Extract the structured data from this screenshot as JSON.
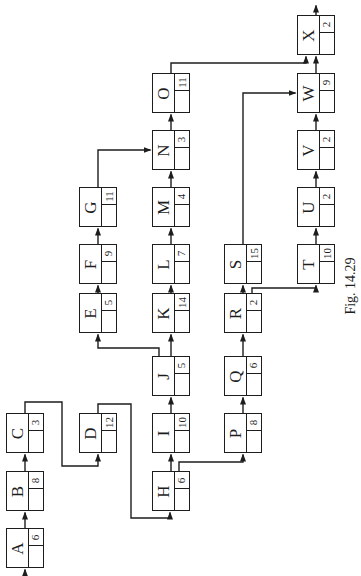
{
  "figure": {
    "caption": "Fig. 14.29",
    "kind": "activity-network-diagram",
    "orientation": "rotated-90-ccw"
  },
  "colors": {
    "background": "#ffffff",
    "ink": "#1d1d1d"
  },
  "diagram": {
    "nodes": [
      {
        "id": "A",
        "duration": "6",
        "col": 0,
        "row": 9
      },
      {
        "id": "B",
        "duration": "8",
        "col": 0,
        "row": 8
      },
      {
        "id": "C",
        "duration": "3",
        "col": 0,
        "row": 7
      },
      {
        "id": "D",
        "duration": "12",
        "col": 1,
        "row": 7
      },
      {
        "id": "E",
        "duration": "5",
        "col": 1,
        "row": 5
      },
      {
        "id": "F",
        "duration": "9",
        "col": 1,
        "row": 4
      },
      {
        "id": "G",
        "duration": "11",
        "col": 1,
        "row": 3
      },
      {
        "id": "H",
        "duration": "6",
        "col": 2,
        "row": 8
      },
      {
        "id": "I",
        "duration": "10",
        "col": 2,
        "row": 7
      },
      {
        "id": "J",
        "duration": "5",
        "col": 2,
        "row": 6
      },
      {
        "id": "K",
        "duration": "14",
        "col": 2,
        "row": 5
      },
      {
        "id": "L",
        "duration": "7",
        "col": 2,
        "row": 4
      },
      {
        "id": "M",
        "duration": "4",
        "col": 2,
        "row": 3
      },
      {
        "id": "N",
        "duration": "3",
        "col": 2,
        "row": 2
      },
      {
        "id": "O",
        "duration": "11",
        "col": 2,
        "row": 1
      },
      {
        "id": "P",
        "duration": "8",
        "col": 3,
        "row": 7
      },
      {
        "id": "Q",
        "duration": "6",
        "col": 3,
        "row": 6
      },
      {
        "id": "R",
        "duration": "2",
        "col": 3,
        "row": 5
      },
      {
        "id": "S",
        "duration": "15",
        "col": 3,
        "row": 4
      },
      {
        "id": "T",
        "duration": "10",
        "col": 4,
        "row": 4
      },
      {
        "id": "U",
        "duration": "2",
        "col": 4,
        "row": 3
      },
      {
        "id": "V",
        "duration": "2",
        "col": 4,
        "row": 2
      },
      {
        "id": "W",
        "duration": "9",
        "col": 4,
        "row": 1
      },
      {
        "id": "X",
        "duration": "2",
        "col": 4,
        "row": 0
      }
    ],
    "edges": [
      {
        "from": "start",
        "to": "A"
      },
      {
        "from": "A",
        "to": "B"
      },
      {
        "from": "B",
        "to": "C"
      },
      {
        "from": "C",
        "to": "D"
      },
      {
        "from": "D",
        "to": "H"
      },
      {
        "from": "H",
        "to": "I"
      },
      {
        "from": "I",
        "to": "J"
      },
      {
        "from": "J",
        "to": "K"
      },
      {
        "from": "J",
        "to": "E"
      },
      {
        "from": "E",
        "to": "F"
      },
      {
        "from": "F",
        "to": "G"
      },
      {
        "from": "G",
        "to": "N"
      },
      {
        "from": "K",
        "to": "L"
      },
      {
        "from": "L",
        "to": "M"
      },
      {
        "from": "M",
        "to": "N"
      },
      {
        "from": "N",
        "to": "O"
      },
      {
        "from": "O",
        "to": "X"
      },
      {
        "from": "H",
        "to": "P"
      },
      {
        "from": "P",
        "to": "Q"
      },
      {
        "from": "Q",
        "to": "R"
      },
      {
        "from": "R",
        "to": "S"
      },
      {
        "from": "R",
        "to": "T"
      },
      {
        "from": "S",
        "to": "W"
      },
      {
        "from": "T",
        "to": "U"
      },
      {
        "from": "U",
        "to": "V"
      },
      {
        "from": "V",
        "to": "W"
      },
      {
        "from": "W",
        "to": "X"
      },
      {
        "from": "X",
        "to": "end"
      }
    ]
  }
}
